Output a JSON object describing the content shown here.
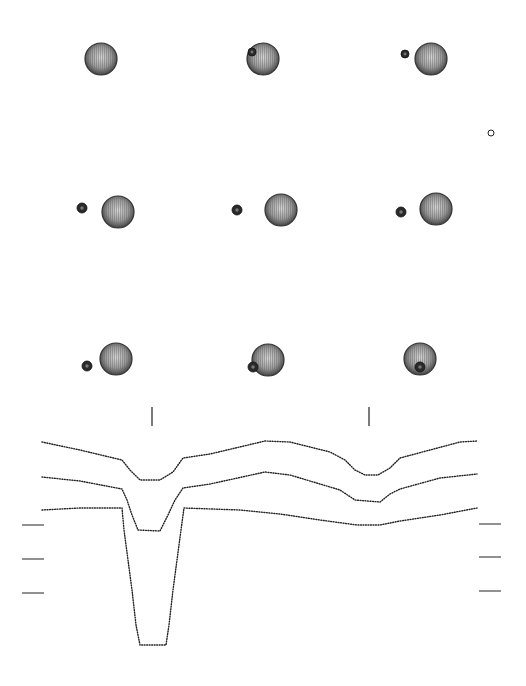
{
  "chart_data": {
    "type": "line",
    "title": "",
    "xlabel": "",
    "ylabel": "",
    "grid": false,
    "legend": null,
    "configurations": [
      {
        "panel": 1,
        "primary": {
          "cx": 101,
          "cy": 59,
          "r": 16
        },
        "companion": null
      },
      {
        "panel": 2,
        "primary": {
          "cx": 263,
          "cy": 59,
          "r": 16
        },
        "companion": {
          "cx": 252,
          "cy": 52,
          "r": 4,
          "position": "in-front-limb"
        }
      },
      {
        "panel": 3,
        "primary": {
          "cx": 431,
          "cy": 59,
          "r": 16
        },
        "companion": {
          "cx": 405,
          "cy": 54,
          "r": 4
        }
      },
      {
        "panel": 4,
        "primary": {
          "cx": 118,
          "cy": 212,
          "r": 16
        },
        "companion": {
          "cx": 82,
          "cy": 208,
          "r": 5
        }
      },
      {
        "panel": 5,
        "primary": {
          "cx": 281,
          "cy": 210,
          "r": 16
        },
        "companion": {
          "cx": 237,
          "cy": 210,
          "r": 5
        }
      },
      {
        "panel": 6,
        "primary": {
          "cx": 436,
          "cy": 209,
          "r": 16
        },
        "companion": {
          "cx": 401,
          "cy": 212,
          "r": 5
        }
      },
      {
        "panel": 7,
        "primary": {
          "cx": 116,
          "cy": 359,
          "r": 16
        },
        "companion": {
          "cx": 87,
          "cy": 366,
          "r": 5
        }
      },
      {
        "panel": 8,
        "primary": {
          "cx": 268,
          "cy": 360,
          "r": 16
        },
        "companion": {
          "cx": 253,
          "cy": 367,
          "r": 5,
          "position": "in-front-limb"
        }
      },
      {
        "panel": 9,
        "primary": {
          "cx": 420,
          "cy": 359,
          "r": 16
        },
        "companion": {
          "cx": 420,
          "cy": 367,
          "r": 5,
          "position": "transit-center"
        }
      }
    ],
    "marker_small_circle": {
      "cx": 491,
      "cy": 133,
      "r": 3
    },
    "eclipse_markers": [
      {
        "x": 152,
        "y1": 407,
        "y2": 426
      },
      {
        "x": 369,
        "y1": 407,
        "y2": 426
      }
    ],
    "series": [
      {
        "name": "curve-1",
        "points": [
          [
            42,
            442
          ],
          [
            80,
            450
          ],
          [
            122,
            460
          ],
          [
            130,
            470
          ],
          [
            140,
            480
          ],
          [
            160,
            480
          ],
          [
            173,
            472
          ],
          [
            183,
            458
          ],
          [
            210,
            454
          ],
          [
            265,
            441
          ],
          [
            290,
            442
          ],
          [
            330,
            452
          ],
          [
            345,
            460
          ],
          [
            355,
            470
          ],
          [
            365,
            475
          ],
          [
            378,
            475
          ],
          [
            390,
            468
          ],
          [
            400,
            458
          ],
          [
            430,
            450
          ],
          [
            460,
            442
          ],
          [
            477,
            441
          ]
        ]
      },
      {
        "name": "curve-2",
        "points": [
          [
            42,
            477
          ],
          [
            80,
            481
          ],
          [
            122,
            489
          ],
          [
            127,
            500
          ],
          [
            132,
            515
          ],
          [
            138,
            530
          ],
          [
            160,
            531
          ],
          [
            168,
            515
          ],
          [
            175,
            500
          ],
          [
            183,
            488
          ],
          [
            210,
            484
          ],
          [
            265,
            472
          ],
          [
            290,
            475
          ],
          [
            340,
            490
          ],
          [
            355,
            500
          ],
          [
            380,
            502
          ],
          [
            390,
            494
          ],
          [
            400,
            489
          ],
          [
            440,
            478
          ],
          [
            477,
            474
          ]
        ]
      },
      {
        "name": "curve-3",
        "points": [
          [
            42,
            510
          ],
          [
            80,
            508
          ],
          [
            122,
            508
          ],
          [
            124,
            530
          ],
          [
            128,
            560
          ],
          [
            132,
            590
          ],
          [
            136,
            625
          ],
          [
            140,
            645
          ],
          [
            166,
            645
          ],
          [
            169,
            625
          ],
          [
            173,
            590
          ],
          [
            177,
            560
          ],
          [
            181,
            530
          ],
          [
            184,
            508
          ],
          [
            240,
            510
          ],
          [
            280,
            514
          ],
          [
            320,
            520
          ],
          [
            357,
            525
          ],
          [
            380,
            525
          ],
          [
            400,
            521
          ],
          [
            440,
            515
          ],
          [
            477,
            508
          ]
        ]
      }
    ],
    "scale_ticks_left": [
      {
        "x1": 22,
        "x2": 44,
        "y": 525
      },
      {
        "x1": 22,
        "x2": 44,
        "y": 559
      },
      {
        "x1": 22,
        "x2": 44,
        "y": 593
      }
    ],
    "scale_ticks_right": [
      {
        "x1": 479,
        "x2": 501,
        "y": 524
      },
      {
        "x1": 479,
        "x2": 501,
        "y": 557
      },
      {
        "x1": 479,
        "x2": 501,
        "y": 591
      }
    ]
  },
  "colors": {
    "background": "#ffffff",
    "ink": "#222222",
    "star_fill": "#8a8a8a",
    "star_edge": "#333333",
    "companion_fill": "#2a2a2a"
  }
}
